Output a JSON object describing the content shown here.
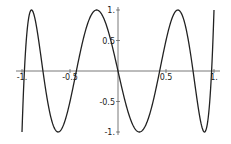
{
  "chart_data": {
    "type": "line",
    "title": "",
    "xlabel": "",
    "ylabel": "",
    "function": "T7(x) = 64x^7 - 112x^5 + 56x^3 - 7x (Chebyshev polynomial of degree 7)",
    "xlim": [
      -1,
      1
    ],
    "ylim": [
      -1,
      1
    ],
    "grid": false,
    "legend": null,
    "x_ticks": [
      {
        "value": -1,
        "label": "-1."
      },
      {
        "value": -0.5,
        "label": "-0.5"
      },
      {
        "value": 0.5,
        "label": "0.5"
      },
      {
        "value": 1,
        "label": "1."
      }
    ],
    "y_ticks": [
      {
        "value": 1,
        "label": "1."
      },
      {
        "value": 0.5,
        "label": "0.5"
      },
      {
        "value": -0.5,
        "label": "-0.5"
      },
      {
        "value": -1,
        "label": "-1."
      }
    ],
    "series": [
      {
        "name": "T7",
        "color": "#222222",
        "x": [
          -1,
          -0.975,
          -0.9749,
          -0.9,
          -0.7818,
          -0.6235,
          -0.4339,
          -0.2225,
          0,
          0.2225,
          0.4339,
          0.6235,
          0.7818,
          0.9,
          0.9749,
          1
        ],
        "y": [
          -1,
          0,
          0,
          1,
          0,
          -1,
          0,
          1,
          0,
          -1,
          0,
          1,
          0,
          -1,
          0,
          1
        ]
      }
    ]
  },
  "colors": {
    "axis": "#555555",
    "curve": "#222222",
    "background": "#ffffff"
  }
}
